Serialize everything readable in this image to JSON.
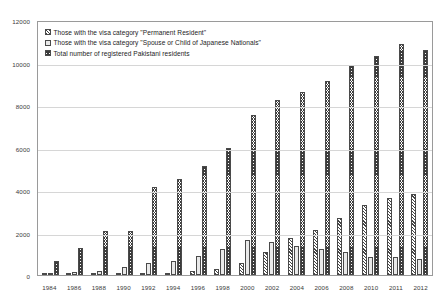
{
  "chart_data": {
    "type": "bar",
    "title": "",
    "xlabel": "",
    "ylabel": "",
    "ylim": [
      0,
      12000
    ],
    "grid": true,
    "legend_position": "top-left",
    "categories": [
      "1984",
      "1986",
      "1988",
      "1990",
      "1992",
      "1994",
      "1996",
      "1998",
      "2000",
      "2002",
      "2004",
      "2006",
      "2008",
      "2010",
      "2011",
      "2012"
    ],
    "y_ticks": [
      "0",
      "2000",
      "4000",
      "6000",
      "8000",
      "10000",
      "12000"
    ],
    "y_tick_values": [
      0,
      2000,
      4000,
      6000,
      8000,
      10000,
      12000
    ],
    "series": [
      {
        "name": "Those with the visa category \"Permanent Resident\"",
        "key": "permanent_resident",
        "fill": "fill-pr",
        "values": [
          20,
          30,
          40,
          50,
          80,
          110,
          180,
          260,
          550,
          1080,
          1730,
          2120,
          2700,
          3290,
          3610,
          3790
        ]
      },
      {
        "name": "Those with the visa category \"Spouse or Child of Japanese Nationals\"",
        "key": "spouse_or_child",
        "fill": "fill-spouse",
        "values": [
          110,
          140,
          210,
          390,
          550,
          680,
          890,
          1230,
          1640,
          1560,
          1380,
          1240,
          1060,
          870,
          830,
          760
        ]
      },
      {
        "name": "Total number of registered Pakistani residents",
        "key": "total_registered",
        "fill": "fill-total",
        "values": [
          670,
          1280,
          2060,
          2070,
          4130,
          4500,
          5130,
          6000,
          7520,
          8250,
          8620,
          9130,
          9890,
          10300,
          10860,
          10600
        ]
      }
    ]
  },
  "legend": {
    "items": [
      {
        "label": "Those with the visa category \"Permanent Resident\"",
        "fill": "fill-pr"
      },
      {
        "label": "Those with the visa category \"Spouse or Child of Japanese Nationals\"",
        "fill": "fill-spouse"
      },
      {
        "label": "Total number of registered Pakistani residents",
        "fill": "fill-total"
      }
    ]
  },
  "colors": {
    "axis": "#9a9a9a",
    "gridline": "#d6d6d6",
    "text": "#3a3a3a",
    "bar_outline": "#4a4a4a"
  }
}
